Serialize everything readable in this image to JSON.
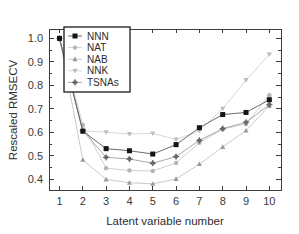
{
  "chart_data": {
    "type": "line",
    "title": "",
    "xlabel": "Latent variable number",
    "ylabel": "Rescaled RMSECV",
    "x": [
      1,
      2,
      3,
      4,
      5,
      6,
      7,
      8,
      9,
      10
    ],
    "xlim": [
      0.55,
      10.5
    ],
    "ylim": [
      0.355,
      1.04
    ],
    "xticks": [
      "1",
      "2",
      "3",
      "4",
      "5",
      "6",
      "7",
      "8",
      "9",
      "10"
    ],
    "yticks": [
      "0.4",
      "0.5",
      "0.6",
      "0.7",
      "0.8",
      "0.9",
      "1.0"
    ],
    "ytick_values": [
      0.4,
      0.5,
      0.6,
      0.7,
      0.8,
      0.9,
      1.0
    ],
    "grid": false,
    "legend_position": "upper-left",
    "series": [
      {
        "name": "NNN",
        "marker": "square",
        "color": "#141414",
        "line_color": "#5a5a5a",
        "marker_size": 5.0,
        "values": [
          1.0,
          0.605,
          0.531,
          0.522,
          0.508,
          0.548,
          0.62,
          0.676,
          0.685,
          0.739
        ]
      },
      {
        "name": "NAT",
        "marker": "circle",
        "color": "#b4b4b4",
        "line_color": "#cacaca",
        "marker_size": 4.4,
        "values": [
          1.0,
          0.632,
          0.448,
          0.438,
          0.436,
          0.47,
          0.556,
          0.614,
          0.636,
          0.758
        ]
      },
      {
        "name": "NAB",
        "marker": "triangle-up",
        "color": "#9a9a9a",
        "line_color": "#c4c4c4",
        "marker_size": 4.6,
        "values": [
          1.0,
          0.483,
          0.4,
          0.386,
          0.381,
          0.402,
          0.465,
          0.538,
          0.608,
          0.713
        ]
      },
      {
        "name": "NNK",
        "marker": "triangle-down",
        "color": "#bcbcbc",
        "line_color": "#d2d2d2",
        "marker_size": 4.6,
        "values": [
          1.0,
          0.606,
          0.601,
          0.593,
          0.596,
          0.57,
          0.607,
          0.701,
          0.823,
          0.932
        ]
      },
      {
        "name": "TSNAs",
        "marker": "circle-cross",
        "color": "#686868",
        "line_color": "#9e9e9e",
        "marker_size": 4.8,
        "values": [
          1.0,
          0.608,
          0.494,
          0.487,
          0.469,
          0.497,
          0.566,
          0.616,
          0.643,
          0.718
        ]
      }
    ]
  },
  "legend": {
    "entries": [
      "NNN",
      "NAT",
      "NAB",
      "NNK",
      "TSNAs"
    ]
  },
  "axes": {
    "x_title": "Latent variable number",
    "y_title": "Rescaled RMSECV"
  }
}
